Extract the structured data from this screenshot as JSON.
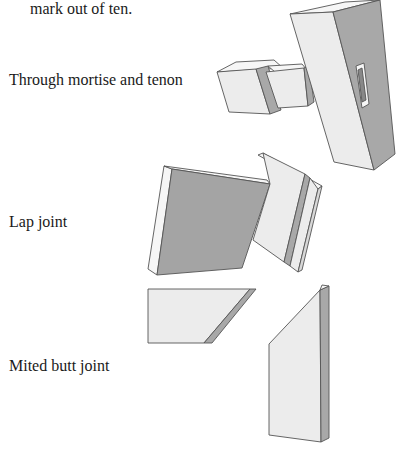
{
  "document": {
    "intro_text": "mark out of ten.",
    "joints": [
      {
        "label": "Through mortise and tenon"
      },
      {
        "label": "Lap joint"
      },
      {
        "label": "Mited butt joint"
      }
    ]
  },
  "colors": {
    "light_face": "#ececec",
    "top_face": "#f6f6f6",
    "shadow_face": "#a8a8a8",
    "dark_face": "#9a9a9a",
    "edge": "#555555",
    "text": "#1a1a1a"
  }
}
